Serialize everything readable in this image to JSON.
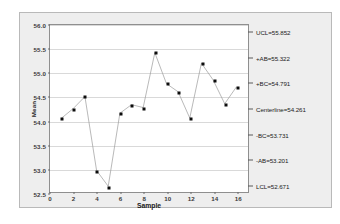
{
  "chart_data": {
    "type": "line",
    "title": "",
    "xlabel": "Sample",
    "ylabel": "Mean",
    "xlim": [
      0,
      17
    ],
    "ylim": [
      52.5,
      56.0
    ],
    "grid": true,
    "legend": "none",
    "x": [
      1,
      2,
      3,
      4,
      5,
      6,
      7,
      8,
      9,
      10,
      11,
      12,
      13,
      14,
      15,
      16
    ],
    "categories": [
      "1",
      "2",
      "3",
      "4",
      "5",
      "6",
      "7",
      "8",
      "9",
      "10",
      "11",
      "12",
      "13",
      "14",
      "15",
      "16"
    ],
    "values": [
      54.05,
      54.25,
      54.5,
      52.95,
      52.62,
      54.15,
      54.33,
      54.27,
      55.42,
      54.77,
      54.6,
      54.05,
      55.2,
      54.85,
      54.35,
      54.7
    ],
    "series": [
      {
        "name": "Mean",
        "marker": "square",
        "color": "#0d0d0d",
        "line_color": "#9a9a9a",
        "values": [
          54.05,
          54.25,
          54.5,
          52.95,
          52.62,
          54.15,
          54.33,
          54.27,
          55.42,
          54.77,
          54.6,
          54.05,
          55.2,
          54.85,
          54.35,
          54.7
        ]
      }
    ],
    "ytick_labels": [
      "56.0",
      "55.5",
      "55.0",
      "54.5",
      "54.0",
      "53.5",
      "53.0",
      "52.5"
    ],
    "ytick_values": [
      56.0,
      55.5,
      55.0,
      54.5,
      54.0,
      53.5,
      53.0,
      52.5
    ],
    "xtick_labels": [
      "0",
      "2",
      "4",
      "6",
      "8",
      "10",
      "12",
      "14",
      "16"
    ],
    "xtick_values": [
      0,
      2,
      4,
      6,
      8,
      10,
      12,
      14,
      16
    ],
    "control_limits": [
      {
        "label": "UCL=55.852",
        "value": 55.852,
        "name": "ucl"
      },
      {
        "label": "+AB=55.322",
        "value": 55.322,
        "name": "plus-ab"
      },
      {
        "label": "+BC=54.791",
        "value": 54.791,
        "name": "plus-bc"
      },
      {
        "label": "Centerline=54.261",
        "value": 54.261,
        "name": "centerline"
      },
      {
        "label": "-BC=53.731",
        "value": 53.731,
        "name": "minus-bc"
      },
      {
        "label": "-AB=53.201",
        "value": 53.201,
        "name": "minus-ab"
      },
      {
        "label": "LCL=52.671",
        "value": 52.671,
        "name": "lcl"
      }
    ],
    "colors": {
      "figure_background": "#eeeeee",
      "plot_background": "#ffffff",
      "grid": "#d9d9d9",
      "marker": "#0d0d0d",
      "line": "#9a9a9a",
      "axis": "#8f8f8f",
      "text": "#1a1a1a"
    }
  }
}
